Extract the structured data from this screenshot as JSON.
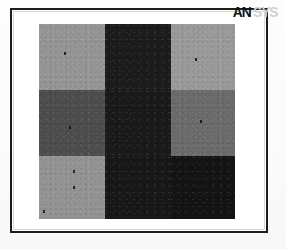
{
  "figure": {
    "frame_color": "#1d1d1d",
    "background_color": "#ffffff"
  },
  "watermark": {
    "name": "ansys-logo",
    "primary_text": "AN",
    "secondary_text": "SYS",
    "primary_color": "#111111",
    "secondary_color": "#cfcfcf"
  },
  "chart_data": {
    "type": "heatmap",
    "title": "",
    "subtitle": "",
    "xlabel": "",
    "ylabel": "",
    "grid": false,
    "legend_position": "none",
    "rows": 3,
    "cols": 3,
    "x": [
      "1",
      "2",
      "3"
    ],
    "y": [
      "1",
      "2",
      "3"
    ],
    "categories": [
      "col-1",
      "col-2",
      "col-3"
    ],
    "colorscale": "grayscale",
    "value_range": [
      0,
      255
    ],
    "cells": [
      {
        "row": 0,
        "col": 0,
        "name": "cell-r1c1",
        "value": 150,
        "color": "#969696",
        "speck": true
      },
      {
        "row": 0,
        "col": 1,
        "name": "cell-r1c2",
        "value": 28,
        "color": "#1c1c1c",
        "speck": false
      },
      {
        "row": 0,
        "col": 2,
        "name": "cell-r1c3",
        "value": 155,
        "color": "#9b9b9b",
        "speck": true
      },
      {
        "row": 1,
        "col": 0,
        "name": "cell-r2c1",
        "value": 78,
        "color": "#4e4e4e",
        "speck": true
      },
      {
        "row": 1,
        "col": 1,
        "name": "cell-r2c2",
        "value": 26,
        "color": "#1a1a1a",
        "speck": false
      },
      {
        "row": 1,
        "col": 2,
        "name": "cell-r2c3",
        "value": 108,
        "color": "#6c6c6c",
        "speck": true
      },
      {
        "row": 2,
        "col": 0,
        "name": "cell-r3c1",
        "value": 148,
        "color": "#949494",
        "speck": true
      },
      {
        "row": 2,
        "col": 1,
        "name": "cell-r3c2",
        "value": 24,
        "color": "#181818",
        "speck": false
      },
      {
        "row": 2,
        "col": 2,
        "name": "cell-r3c3",
        "value": 20,
        "color": "#141414",
        "speck": false
      }
    ],
    "values": [
      [
        150,
        28,
        155
      ],
      [
        78,
        26,
        108
      ],
      [
        148,
        24,
        20
      ]
    ],
    "series": [
      {
        "name": "row-1",
        "values": [
          150,
          28,
          155
        ]
      },
      {
        "name": "row-2",
        "values": [
          78,
          26,
          108
        ]
      },
      {
        "name": "row-3",
        "values": [
          148,
          24,
          20
        ]
      }
    ]
  }
}
